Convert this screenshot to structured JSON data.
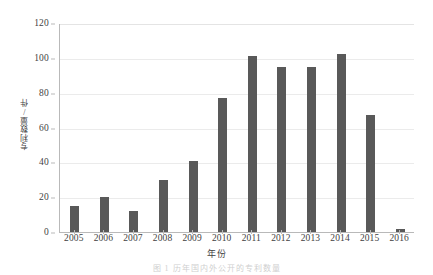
{
  "chart_data": {
    "type": "bar",
    "title": "",
    "xlabel": "年份",
    "ylabel": "专利数量/件",
    "categories": [
      "2005",
      "2006",
      "2007",
      "2008",
      "2009",
      "2010",
      "2011",
      "2012",
      "2013",
      "2014",
      "2015",
      "2016"
    ],
    "values": [
      15,
      20,
      12,
      30,
      41,
      77,
      101,
      95,
      95,
      102,
      67,
      2
    ],
    "ylim": [
      0,
      120
    ],
    "yticks": [
      0,
      20,
      40,
      60,
      80,
      100,
      120
    ],
    "ytick_labels": [
      "0",
      "20",
      "40",
      "60",
      "80",
      "100",
      "120"
    ],
    "grid": true,
    "legend": "none",
    "series": [
      {
        "name": "专利数量/件",
        "values": [
          15,
          20,
          12,
          30,
          41,
          77,
          101,
          95,
          95,
          102,
          67,
          2
        ]
      }
    ]
  },
  "colors": {
    "bar": "#595959",
    "gridline": "#ebebeb",
    "axis": "#b9b9b9",
    "text": "#3f3f3f",
    "background": "#ffffff"
  },
  "caption": {
    "text": "图 1   历年国内外公开的专利数量"
  }
}
